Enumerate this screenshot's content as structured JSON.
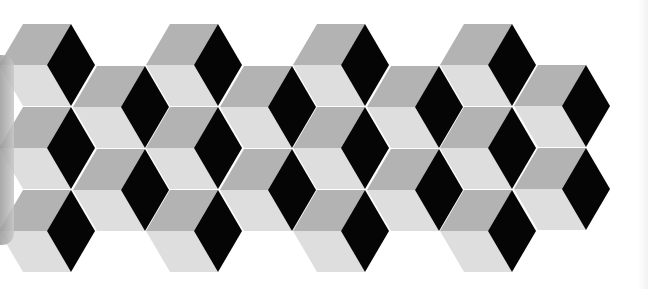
{
  "image": {
    "description": "Tumbling blocks (isometric cube) optical illusion pattern",
    "width": 648,
    "height": 289,
    "background": "#ffffff"
  },
  "colors": {
    "right_face": "#050505",
    "top_face": "#b3b3b3",
    "front_face": "#dedede",
    "edge_shadow": "#a8a8a8"
  },
  "geometry": {
    "half_width": 24,
    "half_height": 41
  },
  "cubes": [
    {
      "x": 71,
      "y": 65
    },
    {
      "x": 218,
      "y": 65
    },
    {
      "x": 365,
      "y": 65
    },
    {
      "x": 512,
      "y": 65
    },
    {
      "x": 145,
      "y": 107
    },
    {
      "x": 292,
      "y": 107
    },
    {
      "x": 439,
      "y": 107
    },
    {
      "x": 586,
      "y": 106
    },
    {
      "x": 71,
      "y": 148
    },
    {
      "x": 218,
      "y": 148
    },
    {
      "x": 365,
      "y": 148
    },
    {
      "x": 512,
      "y": 148
    },
    {
      "x": 145,
      "y": 190
    },
    {
      "x": 292,
      "y": 190
    },
    {
      "x": 439,
      "y": 190
    },
    {
      "x": 586,
      "y": 189
    },
    {
      "x": 71,
      "y": 231
    },
    {
      "x": 218,
      "y": 231
    },
    {
      "x": 365,
      "y": 231
    },
    {
      "x": 512,
      "y": 231
    }
  ]
}
